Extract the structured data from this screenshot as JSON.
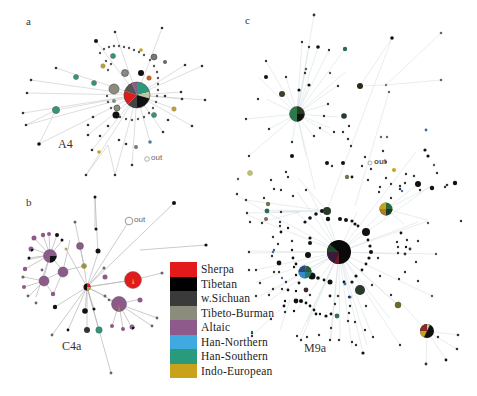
{
  "panels": {
    "a": {
      "letter": "a",
      "haplogroup": "A4",
      "out": "out"
    },
    "b": {
      "letter": "b",
      "haplogroup": "C4a",
      "out": "out"
    },
    "c": {
      "letter": "c",
      "haplogroup": "M9a",
      "out": "out"
    }
  },
  "legend": {
    "items": [
      {
        "label": "Sherpa",
        "color": "#e31a1c"
      },
      {
        "label": "Tibetan",
        "color": "#000000"
      },
      {
        "label": "w.Sichuan",
        "color": "#3a3a3a"
      },
      {
        "label": "Tibeto-Burman",
        "color": "#8c8c7c"
      },
      {
        "label": "Altaic",
        "color": "#8e5a8c"
      },
      {
        "label": "Han-Northern",
        "color": "#3fa9e0"
      },
      {
        "label": "Han-Southern",
        "color": "#2a9a7c"
      },
      {
        "label": "Indo-European",
        "color": "#c9a21b"
      }
    ]
  }
}
